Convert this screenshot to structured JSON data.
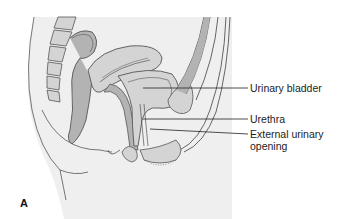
{
  "figure": {
    "panel_letter": "A",
    "labels": [
      {
        "id": "urinary-bladder",
        "text": "Urinary bladder"
      },
      {
        "id": "urethra",
        "text": "Urethra"
      },
      {
        "id": "external-urinary-opening",
        "text": "External urinary opening",
        "line1": "External urinary",
        "line2": "opening"
      }
    ],
    "colors": {
      "background": "#ffffff",
      "panel_fill": "#efefef",
      "organ_fill": "#b3b3b3",
      "organ_light": "#d4d4d4",
      "outline": "#555555",
      "leader_line": "#222222"
    }
  }
}
